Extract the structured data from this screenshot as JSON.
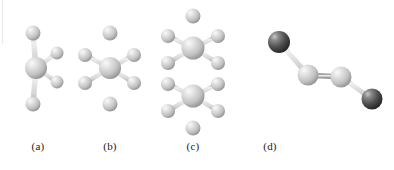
{
  "figure": {
    "background": "#ffffff",
    "width": 394,
    "height": 170,
    "style": "ball-and-stick molecular models"
  },
  "colors": {
    "light_atom": "#c9c9c9",
    "light_atom_highlight": "#f4f4f4",
    "light_atom_shadow": "#8e8e8e",
    "dark_atom": "#4a4a4a",
    "dark_atom_highlight": "#d0d0d0",
    "dark_atom_shadow": "#262626",
    "bond": "#d2d2d2",
    "bond_edge": "#9a9a9a",
    "caption_text": "#1a1a1a"
  },
  "panels": [
    {
      "id": "a",
      "caption": "(a)",
      "geometry": "tetrahedral-like central atom with four bonds",
      "center_atom": {
        "cx": 36,
        "cy": 68,
        "r": 11,
        "shade": "light"
      },
      "ligands": [
        {
          "cx": 33,
          "cy": 33,
          "r": 7.5,
          "shade": "light"
        },
        {
          "cx": 33,
          "cy": 104,
          "r": 7.5,
          "shade": "light"
        },
        {
          "cx": 57,
          "cy": 53,
          "r": 6.5,
          "shade": "light"
        },
        {
          "cx": 57,
          "cy": 82,
          "r": 6.5,
          "shade": "light"
        }
      ]
    },
    {
      "id": "b",
      "caption": "(b)",
      "geometry": "octahedral central atom with six bonds",
      "center_atom": {
        "cx": 110,
        "cy": 68,
        "r": 11,
        "shade": "light"
      },
      "ligands": [
        {
          "cx": 110,
          "cy": 33,
          "r": 7.5,
          "shade": "light"
        },
        {
          "cx": 110,
          "cy": 104,
          "r": 7.5,
          "shade": "light"
        },
        {
          "cx": 85,
          "cy": 55,
          "r": 7,
          "shade": "light"
        },
        {
          "cx": 85,
          "cy": 83,
          "r": 7,
          "shade": "light"
        },
        {
          "cx": 134,
          "cy": 55,
          "r": 7,
          "shade": "light"
        },
        {
          "cx": 134,
          "cy": 83,
          "r": 7,
          "shade": "light"
        }
      ]
    },
    {
      "id": "c",
      "caption": "(c)",
      "geometry": "dimer of two stacked octahedral units sharing a vertical bond",
      "units": [
        {
          "center_atom": {
            "cx": 193,
            "cy": 48,
            "r": 11.5,
            "shade": "light"
          },
          "ligands": [
            {
              "cx": 193,
              "cy": 16,
              "r": 7.5,
              "shade": "light"
            },
            {
              "cx": 168,
              "cy": 36,
              "r": 7,
              "shade": "light"
            },
            {
              "cx": 168,
              "cy": 63,
              "r": 7,
              "shade": "light"
            },
            {
              "cx": 218,
              "cy": 36,
              "r": 7,
              "shade": "light"
            },
            {
              "cx": 218,
              "cy": 63,
              "r": 7,
              "shade": "light"
            }
          ]
        },
        {
          "center_atom": {
            "cx": 193,
            "cy": 96,
            "r": 11.5,
            "shade": "light"
          },
          "ligands": [
            {
              "cx": 193,
              "cy": 128,
              "r": 7.5,
              "shade": "light"
            },
            {
              "cx": 168,
              "cy": 84,
              "r": 7,
              "shade": "light"
            },
            {
              "cx": 168,
              "cy": 111,
              "r": 7,
              "shade": "light"
            },
            {
              "cx": 218,
              "cy": 84,
              "r": 7,
              "shade": "light"
            },
            {
              "cx": 218,
              "cy": 111,
              "r": 7,
              "shade": "light"
            }
          ]
        }
      ]
    },
    {
      "id": "d",
      "caption": "(d)",
      "geometry": "bent zigzag four-atom chain with dark terminal atoms",
      "atoms": [
        {
          "cx": 279,
          "cy": 42,
          "r": 11,
          "shade": "dark"
        },
        {
          "cx": 308,
          "cy": 75,
          "r": 10.5,
          "shade": "light"
        },
        {
          "cx": 341,
          "cy": 77,
          "r": 10.5,
          "shade": "light"
        },
        {
          "cx": 372,
          "cy": 99,
          "r": 10.5,
          "shade": "dark"
        }
      ],
      "bonds": [
        {
          "from": 0,
          "to": 1
        },
        {
          "from": 1,
          "to": 2
        },
        {
          "from": 2,
          "to": 3
        }
      ]
    }
  ],
  "captions": {
    "a": "(a)",
    "b": "(b)",
    "c": "(c)",
    "d": "(d)",
    "y": 147
  }
}
